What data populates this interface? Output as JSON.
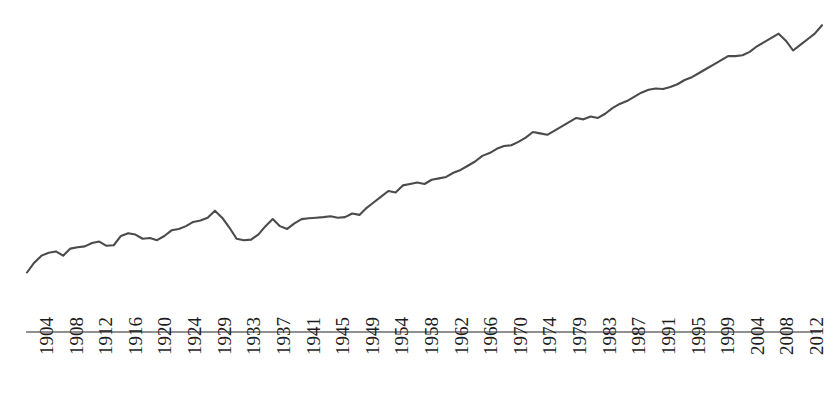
{
  "chart_data": {
    "type": "line",
    "title": "",
    "subtitle": "",
    "xlabel": "",
    "ylabel": "",
    "grid": false,
    "legend": "none",
    "line_color": "#4c4a4a",
    "axis_color": "#6b6b6b",
    "background_color": "#ffffff",
    "xlim": [
      1903,
      2013
    ],
    "ylim": [
      0,
      100
    ],
    "tick_labels": [
      "1904",
      "1908",
      "1912",
      "1916",
      "1920",
      "1924",
      "1929",
      "1933",
      "1937",
      "1941",
      "1945",
      "1949",
      "1954",
      "1958",
      "1962",
      "1966",
      "1970",
      "1974",
      "1979",
      "1983",
      "1987",
      "1991",
      "1995",
      "1999",
      "2004",
      "2008",
      "2012"
    ],
    "x": [
      1903,
      1904,
      1905,
      1906,
      1907,
      1908,
      1909,
      1910,
      1911,
      1912,
      1913,
      1914,
      1915,
      1916,
      1917,
      1918,
      1919,
      1920,
      1921,
      1922,
      1923,
      1924,
      1925,
      1926,
      1927,
      1928,
      1929,
      1930,
      1931,
      1932,
      1933,
      1934,
      1935,
      1936,
      1937,
      1938,
      1939,
      1940,
      1941,
      1942,
      1943,
      1944,
      1945,
      1946,
      1947,
      1948,
      1949,
      1950,
      1951,
      1952,
      1953,
      1954,
      1955,
      1956,
      1957,
      1958,
      1959,
      1960,
      1961,
      1962,
      1963,
      1964,
      1965,
      1966,
      1967,
      1968,
      1969,
      1970,
      1971,
      1972,
      1973,
      1974,
      1975,
      1976,
      1977,
      1978,
      1979,
      1980,
      1981,
      1982,
      1983,
      1984,
      1985,
      1986,
      1987,
      1988,
      1989,
      1990,
      1991,
      1992,
      1993,
      1994,
      1995,
      1996,
      1997,
      1998,
      1999,
      2000,
      2001,
      2002,
      2003,
      2004,
      2005,
      2006,
      2007,
      2008,
      2009,
      2010,
      2011,
      2012,
      2013
    ],
    "values": [
      10.5,
      14.0,
      16.5,
      17.5,
      18.0,
      16.5,
      19.0,
      19.5,
      19.8,
      21.0,
      21.5,
      20.0,
      20.2,
      23.5,
      24.5,
      24.0,
      22.5,
      22.8,
      22.0,
      23.5,
      25.5,
      26.0,
      27.0,
      28.5,
      29.0,
      30.0,
      32.5,
      30.0,
      26.5,
      22.5,
      22.0,
      22.2,
      24.0,
      27.0,
      29.5,
      27.0,
      26.0,
      28.0,
      29.5,
      29.8,
      30.0,
      30.2,
      30.5,
      30.0,
      30.2,
      31.5,
      31.0,
      33.5,
      35.5,
      37.5,
      39.5,
      39.0,
      41.5,
      42.0,
      42.5,
      42.0,
      43.5,
      44.0,
      44.5,
      46.0,
      47.0,
      48.5,
      50.0,
      52.0,
      53.0,
      54.5,
      55.5,
      55.8,
      57.0,
      58.5,
      60.5,
      60.0,
      59.5,
      61.0,
      62.5,
      64.0,
      65.5,
      65.0,
      66.0,
      65.5,
      67.0,
      69.0,
      70.5,
      71.5,
      73.0,
      74.5,
      75.5,
      76.0,
      75.8,
      76.5,
      77.5,
      79.0,
      80.0,
      81.5,
      83.0,
      84.5,
      86.0,
      87.5,
      87.5,
      87.8,
      89.0,
      91.0,
      92.5,
      94.0,
      95.5,
      93.0,
      89.5,
      91.5,
      93.5,
      95.5,
      98.5
    ]
  },
  "axis": {
    "line_present": true,
    "tick_label_rotation_degrees": -90
  }
}
